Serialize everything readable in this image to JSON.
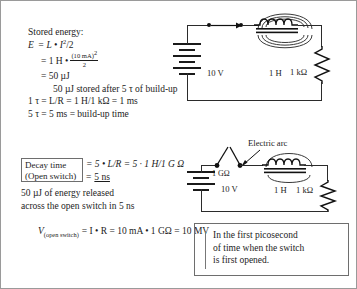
{
  "figure": {
    "title_hidden": "Inductor stored energy and open-switch arc figure"
  },
  "stored_energy": {
    "heading": "Stored energy:",
    "line1_lhs": "E",
    "line1_rhs": "= L • I",
    "line1_exp": "2",
    "line1_tail": "/2",
    "line2_prefix": "= 1 H •",
    "line2_num": "(10 mA)",
    "line2_num_exp": "2",
    "line2_den": "2",
    "line3": "= 50 µJ",
    "line4": "50 µJ stored after 5 τ of build-up",
    "line5": "1 τ = L/R = 1 H/1 kΩ = 1 ms",
    "line6": "5 τ = 5 ms = build-up time"
  },
  "decay": {
    "box_line1": "Decay time",
    "box_line2": "(Open switch)",
    "eq_line1": "= 5 • L/R = 5 · 1 H/1 G Ω",
    "eq_line2_prefix": "=",
    "eq_line2_value": "5 ns",
    "note_line1": "50 µJ of energy released",
    "note_line2": "across the open switch in 5 ns"
  },
  "voltage": {
    "v_symbol": "V",
    "v_sub": "(open switch)",
    "equation": "= I • R = 10 mA • 1 GΩ = 10 MV"
  },
  "callout": {
    "line1": "In the first picosecond",
    "line2": "of time when the switch",
    "line3": "is first opened."
  },
  "circuit_top": {
    "battery_label": "10 V",
    "inductor_label": "1 H",
    "resistor_label": "1 kΩ",
    "switch_state": "closed",
    "current_arrow": "right"
  },
  "circuit_bottom": {
    "battery_label": "10 V",
    "inductor_label": "1 H",
    "resistor_label": "1 kΩ",
    "switch_label": "1 GΩ",
    "arc_label": "Electric arc",
    "switch_state": "open"
  },
  "colors": {
    "ink": "#1c1c1c",
    "wire": "#2b2b2b",
    "box_border": "#6e6e6e",
    "page_border": "#9a9a9a",
    "background": "#ffffff"
  }
}
